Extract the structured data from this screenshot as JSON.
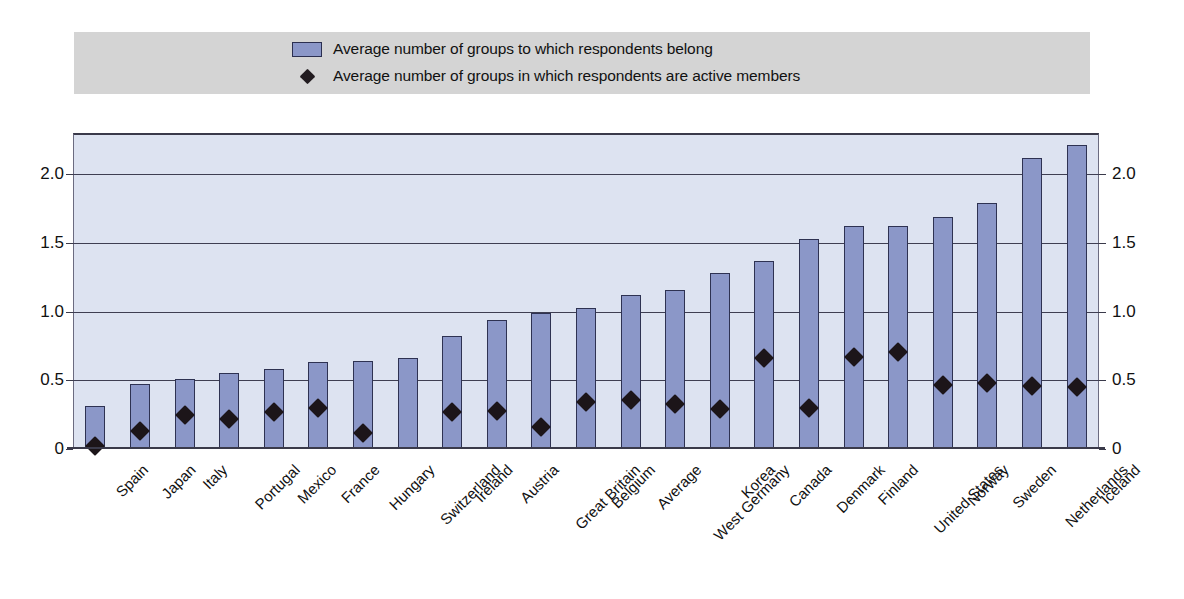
{
  "legend": {
    "items": [
      {
        "marker": "bar-swatch-icon",
        "label": "Average number of groups to which respondents belong"
      },
      {
        "marker": "diamond-marker-icon",
        "label": "Average number of groups in which respondents are active members"
      }
    ]
  },
  "axis": {
    "y_ticks": [
      "2.0",
      "1.5",
      "1.0",
      "0.5",
      "0"
    ],
    "y_values": [
      2.0,
      1.5,
      1.0,
      0.5,
      0
    ]
  },
  "colors": {
    "bar_fill": "#8b97c8",
    "bar_border": "#2e3252",
    "plot_background": "#dde3f1",
    "legend_background": "#d4d4d4",
    "marker": "#1c1519",
    "gridline": "#3e3e52"
  },
  "chart_data": {
    "type": "bar",
    "title": "",
    "subtitle": "",
    "xlabel": "",
    "ylabel": "",
    "ylim": [
      0,
      2.3
    ],
    "grid": true,
    "legend_position": "top",
    "categories": [
      "Spain",
      "Japan",
      "Italy",
      "Portugal",
      "Mexico",
      "France",
      "Hungary",
      "Switzerland",
      "Ireland",
      "Austria",
      "Great Britain",
      "Belgium",
      "Average",
      "West Germany",
      "Korea",
      "Canada",
      "Denmark",
      "Finland",
      "United States",
      "Norway",
      "Sweden",
      "Netherlands",
      "Iceland"
    ],
    "series": [
      {
        "name": "Average number of groups to which respondents belong",
        "type": "bar",
        "values": [
          0.31,
          0.47,
          0.51,
          0.55,
          0.58,
          0.63,
          0.64,
          0.66,
          0.82,
          0.94,
          0.99,
          1.03,
          1.12,
          1.16,
          1.28,
          1.37,
          1.53,
          1.62,
          1.62,
          1.69,
          1.79,
          2.12,
          2.21
        ]
      },
      {
        "name": "Average number of groups in which respondents are active members",
        "type": "scatter",
        "marker": "diamond",
        "values": [
          0.07,
          0.18,
          0.3,
          0.27,
          0.32,
          0.35,
          0.17,
          null,
          0.32,
          0.33,
          0.21,
          0.39,
          0.41,
          0.38,
          0.34,
          0.71,
          0.35,
          0.72,
          0.76,
          0.52,
          0.53,
          0.51,
          0.5
        ]
      }
    ]
  }
}
